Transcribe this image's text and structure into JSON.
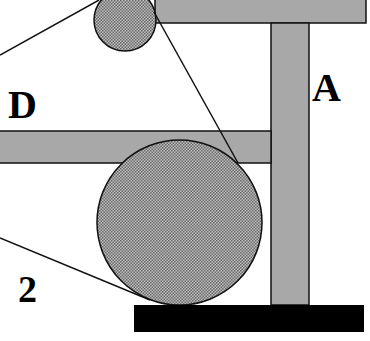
{
  "diagram": {
    "labels": {
      "top_right": "A",
      "left_upper": "D",
      "left_lower": "2"
    },
    "colors": {
      "bar_fill": "#a8a8a8",
      "circle_fill": "#b4b4b4",
      "circle_dot": "#6e6e6e",
      "base_fill": "#000000",
      "stroke": "#111111",
      "background": "#ffffff"
    },
    "components": [
      {
        "name": "top-horizontal-bar"
      },
      {
        "name": "vertical-post"
      },
      {
        "name": "middle-horizontal-bar"
      },
      {
        "name": "small-pulley-circle"
      },
      {
        "name": "large-pulley-circle"
      },
      {
        "name": "base-block"
      },
      {
        "name": "belt-line-upper-left"
      },
      {
        "name": "belt-line-diagonal"
      },
      {
        "name": "belt-line-lower-left"
      }
    ]
  }
}
